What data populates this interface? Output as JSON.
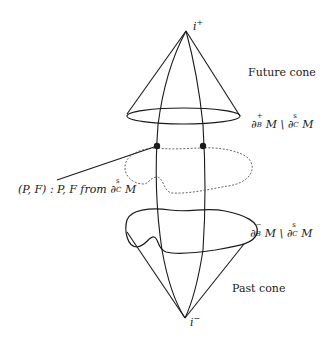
{
  "diagram": {
    "type": "spacetime-cones",
    "labels": {
      "top_apex": "i",
      "top_apex_sup": "+",
      "bottom_apex": "i",
      "bottom_apex_sup": "−",
      "future_cone": "Future cone",
      "past_cone": "Past cone",
      "future_boundary_left": "∂",
      "future_boundary_sup": "+",
      "future_boundary_sub": "B",
      "future_boundary_rest": "M \\ ∂",
      "future_boundary_sup2": "s",
      "future_boundary_sub2": "C",
      "future_boundary_end": "M",
      "past_boundary_left": "∂",
      "past_boundary_sup": "−",
      "past_boundary_sub": "B",
      "past_boundary_rest": "M \\ ∂",
      "past_boundary_sup2": "s",
      "past_boundary_sub2": "C",
      "past_boundary_end": "M",
      "pf_label_prefix": "(P, F) : P, F from ∂",
      "pf_label_sup": "s",
      "pf_label_sub": "C",
      "pf_label_end": "M"
    },
    "colors": {
      "stroke": "#1a1a1a",
      "dashed": "#555555",
      "background": "#ffffff"
    },
    "points": [
      {
        "name": "P",
        "x": 157,
        "y": 146
      },
      {
        "name": "F",
        "x": 203,
        "y": 146
      }
    ]
  }
}
